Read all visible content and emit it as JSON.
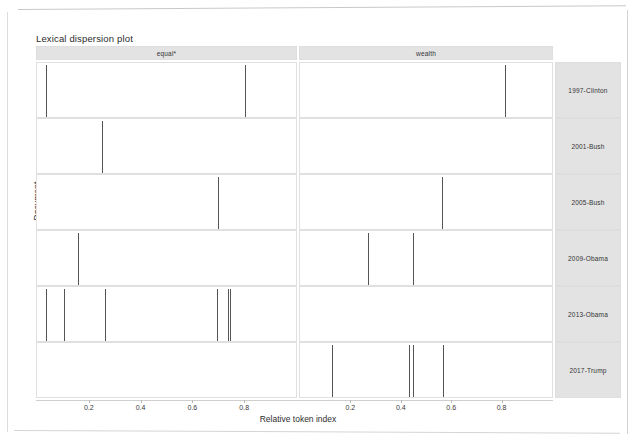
{
  "chart_data": {
    "type": "scatter",
    "title": "Lexical dispersion plot",
    "xlabel": "Relative token index",
    "ylabel": "Document",
    "xlim": [
      0,
      1
    ],
    "grid": false,
    "legend": null,
    "xticks": [
      0.2,
      0.4,
      0.6,
      0.8
    ],
    "xticklabels": [
      "0.2",
      "0.4",
      "0.6",
      "0.8"
    ],
    "facet_columns": [
      "equal*",
      "wealth"
    ],
    "facet_rows": [
      "1997-Clinton",
      "2001-Bush",
      "2005-Bush",
      "2009-Obama",
      "2013-Obama",
      "2017-Trump"
    ],
    "series": [
      {
        "name": "equal* / 1997-Clinton",
        "term": "equal*",
        "document": "1997-Clinton",
        "x": [
          0.036,
          0.802
        ]
      },
      {
        "name": "wealth / 1997-Clinton",
        "term": "wealth",
        "document": "1997-Clinton",
        "x": [
          0.815
        ]
      },
      {
        "name": "equal* / 2001-Bush",
        "term": "equal*",
        "document": "2001-Bush",
        "x": [
          0.251
        ]
      },
      {
        "name": "wealth / 2001-Bush",
        "term": "wealth",
        "document": "2001-Bush",
        "x": []
      },
      {
        "name": "equal* / 2005-Bush",
        "term": "equal*",
        "document": "2005-Bush",
        "x": [
          0.7
        ]
      },
      {
        "name": "wealth / 2005-Bush",
        "term": "wealth",
        "document": "2005-Bush",
        "x": [
          0.565
        ]
      },
      {
        "name": "equal* / 2009-Obama",
        "term": "equal*",
        "document": "2009-Obama",
        "x": [
          0.158
        ]
      },
      {
        "name": "wealth / 2009-Obama",
        "term": "wealth",
        "document": "2009-Obama",
        "x": [
          0.268,
          0.447
        ]
      },
      {
        "name": "equal* / 2013-Obama",
        "term": "equal*",
        "document": "2013-Obama",
        "x": [
          0.033,
          0.105,
          0.264,
          0.694,
          0.736,
          0.746
        ]
      },
      {
        "name": "wealth / 2013-Obama",
        "term": "wealth",
        "document": "2013-Obama",
        "x": []
      },
      {
        "name": "equal* / 2017-Trump",
        "term": "equal*",
        "document": "2017-Trump",
        "x": []
      },
      {
        "name": "wealth / 2017-Trump",
        "term": "wealth",
        "document": "2017-Trump",
        "x": [
          0.127,
          0.432,
          0.45,
          0.569
        ]
      }
    ]
  },
  "chart": {
    "title": "Lexical dispersion plot",
    "x_axis_title": "Relative token index",
    "y_axis_title": "Document"
  },
  "columns": [
    {
      "label": "equal*"
    },
    {
      "label": "wealth"
    }
  ],
  "rows": [
    {
      "label": "1997-Clinton"
    },
    {
      "label": "2001-Bush"
    },
    {
      "label": "2005-Bush"
    },
    {
      "label": "2009-Obama"
    },
    {
      "label": "2013-Obama"
    },
    {
      "label": "2017-Trump"
    }
  ],
  "x_ticks": [
    {
      "label": "0.2"
    },
    {
      "label": "0.4"
    },
    {
      "label": "0.6"
    },
    {
      "label": "0.8"
    }
  ],
  "colors": {
    "tick_mark": "#555555",
    "strip_background": "#e3e3e3",
    "panel_border": "#e0e0e0",
    "text": "#2b2b2b"
  }
}
